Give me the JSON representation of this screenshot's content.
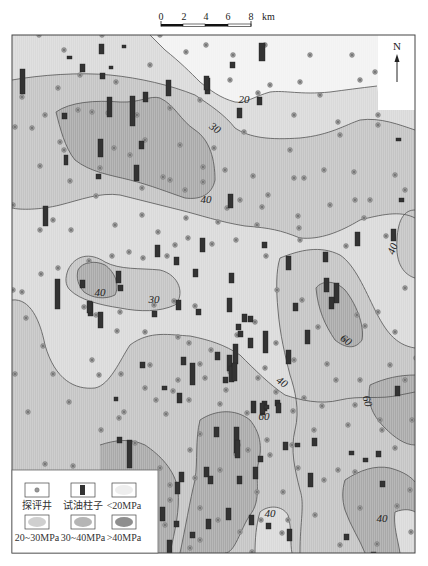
{
  "scale_bar": {
    "ticks": [
      "0",
      "2",
      "4",
      "6",
      "8"
    ],
    "unit": "km"
  },
  "north_arrow": {
    "label": "N"
  },
  "colors": {
    "lt20": "#f2f2f2",
    "20_30": "#dadada",
    "30_40": "#c4c4c4",
    "gt40": "#a9a9a9",
    "contour": "#555555",
    "well_fill": "#9a9a9a",
    "column_fill": "#333333",
    "frame": "#444444"
  },
  "contour_labels": [
    {
      "text": "20",
      "x": 244,
      "y": 103,
      "rot": 0
    },
    {
      "text": "30",
      "x": 213,
      "y": 131,
      "rot": 35
    },
    {
      "text": "40",
      "x": 206,
      "y": 203,
      "rot": 0
    },
    {
      "text": "40",
      "x": 100,
      "y": 296,
      "rot": 0
    },
    {
      "text": "30",
      "x": 154,
      "y": 303,
      "rot": 0
    },
    {
      "text": "40",
      "x": 396,
      "y": 250,
      "rot": -70
    },
    {
      "text": "60",
      "x": 344,
      "y": 343,
      "rot": 35
    },
    {
      "text": "40",
      "x": 280,
      "y": 385,
      "rot": 35
    },
    {
      "text": "60",
      "x": 364,
      "y": 402,
      "rot": 75
    },
    {
      "text": "60",
      "x": 264,
      "y": 420,
      "rot": 0
    },
    {
      "text": "40",
      "x": 270,
      "y": 517,
      "rot": 0
    },
    {
      "text": "40",
      "x": 382,
      "y": 522,
      "rot": 0
    }
  ],
  "legend": {
    "items": [
      {
        "label": "探评井",
        "symbol": "well"
      },
      {
        "label": "试油柱子",
        "symbol": "column"
      },
      {
        "label": "<20MPa",
        "symbol": "zone-lt20"
      },
      {
        "label": "20~30MPa",
        "symbol": "zone-20-30"
      },
      {
        "label": "30~40MPa",
        "symbol": "zone-30-40"
      },
      {
        "label": ">40MPa",
        "symbol": "zone-gt40"
      }
    ]
  },
  "wells": [
    [
      39,
      35
    ],
    [
      64,
      50
    ],
    [
      102,
      35
    ],
    [
      160,
      35
    ],
    [
      206,
      45
    ],
    [
      233,
      55
    ],
    [
      265,
      45
    ],
    [
      310,
      55
    ],
    [
      352,
      55
    ],
    [
      375,
      72
    ],
    [
      58,
      88
    ],
    [
      80,
      75
    ],
    [
      116,
      82
    ],
    [
      150,
      65
    ],
    [
      186,
      52
    ],
    [
      230,
      80
    ],
    [
      270,
      85
    ],
    [
      300,
      82
    ],
    [
      320,
      95
    ],
    [
      360,
      80
    ],
    [
      22,
      97
    ],
    [
      45,
      115
    ],
    [
      78,
      110
    ],
    [
      108,
      113
    ],
    [
      137,
      115
    ],
    [
      170,
      108
    ],
    [
      200,
      100
    ],
    [
      258,
      93
    ],
    [
      294,
      115
    ],
    [
      338,
      122
    ],
    [
      378,
      115
    ],
    [
      60,
      142
    ],
    [
      92,
      112
    ],
    [
      114,
      148
    ],
    [
      145,
      140
    ],
    [
      180,
      145
    ],
    [
      214,
      148
    ],
    [
      244,
      132
    ],
    [
      290,
      150
    ],
    [
      340,
      135
    ],
    [
      378,
      125
    ],
    [
      15,
      127
    ],
    [
      32,
      128
    ],
    [
      64,
      150
    ],
    [
      100,
      168
    ],
    [
      130,
      155
    ],
    [
      163,
      177
    ],
    [
      203,
      167
    ],
    [
      225,
      170
    ],
    [
      253,
      176
    ],
    [
      294,
      178
    ],
    [
      324,
      170
    ],
    [
      354,
      172
    ],
    [
      395,
      175
    ],
    [
      40,
      166
    ],
    [
      70,
      181
    ],
    [
      96,
      196
    ],
    [
      142,
      188
    ],
    [
      170,
      180
    ],
    [
      185,
      190
    ],
    [
      203,
      182
    ],
    [
      240,
      200
    ],
    [
      268,
      195
    ],
    [
      304,
      178
    ],
    [
      355,
      200
    ],
    [
      405,
      190
    ],
    [
      13,
      205
    ],
    [
      53,
      220
    ],
    [
      142,
      215
    ],
    [
      186,
      218
    ],
    [
      227,
      208
    ],
    [
      262,
      207
    ],
    [
      298,
      216
    ],
    [
      330,
      205
    ],
    [
      370,
      200
    ],
    [
      40,
      230
    ],
    [
      71,
      230
    ],
    [
      115,
      225
    ],
    [
      129,
      252
    ],
    [
      158,
      232
    ],
    [
      175,
      245
    ],
    [
      218,
      222
    ],
    [
      257,
      225
    ],
    [
      299,
      228
    ],
    [
      364,
      218
    ],
    [
      22,
      292
    ],
    [
      41,
      274
    ],
    [
      58,
      268
    ],
    [
      89,
      261
    ],
    [
      112,
      256
    ],
    [
      143,
      258
    ],
    [
      167,
      256
    ],
    [
      188,
      238
    ],
    [
      212,
      244
    ],
    [
      236,
      240
    ],
    [
      266,
      256
    ],
    [
      300,
      240
    ],
    [
      346,
      246
    ],
    [
      386,
      236
    ],
    [
      84,
      307
    ],
    [
      96,
      315
    ],
    [
      120,
      312
    ],
    [
      154,
      305
    ],
    [
      174,
      301
    ],
    [
      195,
      306
    ],
    [
      255,
      322
    ],
    [
      277,
      290
    ],
    [
      302,
      300
    ],
    [
      318,
      327
    ],
    [
      357,
      315
    ],
    [
      378,
      312
    ],
    [
      405,
      288
    ],
    [
      13,
      290
    ],
    [
      26,
      318
    ],
    [
      117,
      331
    ],
    [
      145,
      332
    ],
    [
      178,
      337
    ],
    [
      189,
      343
    ],
    [
      211,
      350
    ],
    [
      237,
      335
    ],
    [
      276,
      343
    ],
    [
      344,
      339
    ],
    [
      365,
      326
    ],
    [
      395,
      332
    ],
    [
      43,
      346
    ],
    [
      92,
      360
    ],
    [
      121,
      374
    ],
    [
      150,
      365
    ],
    [
      178,
      380
    ],
    [
      200,
      364
    ],
    [
      230,
      372
    ],
    [
      265,
      368
    ],
    [
      294,
      360
    ],
    [
      327,
      364
    ],
    [
      360,
      380
    ],
    [
      390,
      365
    ],
    [
      416,
      358
    ],
    [
      15,
      374
    ],
    [
      53,
      374
    ],
    [
      99,
      375
    ],
    [
      145,
      388
    ],
    [
      173,
      391
    ],
    [
      205,
      378
    ],
    [
      226,
      390
    ],
    [
      258,
      378
    ],
    [
      276,
      392
    ],
    [
      304,
      398
    ],
    [
      336,
      380
    ],
    [
      355,
      405
    ],
    [
      405,
      380
    ],
    [
      28,
      412
    ],
    [
      69,
      402
    ],
    [
      124,
      412
    ],
    [
      156,
      400
    ],
    [
      189,
      400
    ],
    [
      220,
      404
    ],
    [
      247,
      413
    ],
    [
      293,
      411
    ],
    [
      322,
      406
    ],
    [
      380,
      420
    ],
    [
      101,
      430
    ],
    [
      119,
      418
    ],
    [
      166,
      414
    ],
    [
      200,
      434
    ],
    [
      238,
      445
    ],
    [
      267,
      440
    ],
    [
      292,
      445
    ],
    [
      314,
      430
    ],
    [
      348,
      425
    ],
    [
      382,
      430
    ],
    [
      412,
      420
    ],
    [
      45,
      464
    ],
    [
      73,
      466
    ],
    [
      135,
      443
    ],
    [
      160,
      468
    ],
    [
      190,
      450
    ],
    [
      236,
      454
    ],
    [
      248,
      450
    ],
    [
      270,
      455
    ],
    [
      298,
      468
    ],
    [
      338,
      470
    ],
    [
      395,
      448
    ],
    [
      170,
      485
    ],
    [
      195,
      478
    ],
    [
      220,
      470
    ],
    [
      257,
      492
    ],
    [
      283,
      492
    ],
    [
      324,
      480
    ],
    [
      355,
      472
    ],
    [
      410,
      490
    ],
    [
      170,
      500
    ],
    [
      200,
      508
    ],
    [
      218,
      520
    ],
    [
      261,
      520
    ],
    [
      288,
      520
    ],
    [
      315,
      515
    ],
    [
      360,
      508
    ],
    [
      397,
      506
    ],
    [
      130,
      545
    ],
    [
      165,
      525
    ],
    [
      200,
      540
    ],
    [
      240,
      532
    ],
    [
      282,
      533
    ],
    [
      340,
      545
    ],
    [
      377,
      544
    ],
    [
      411,
      532
    ],
    [
      128,
      555
    ],
    [
      190,
      548
    ],
    [
      234,
      556
    ],
    [
      252,
      552
    ],
    [
      281,
      561
    ],
    [
      315,
      560
    ],
    [
      352,
      560
    ]
  ],
  "columns": [
    [
      99,
      44,
      5,
      10
    ],
    [
      67,
      56,
      5,
      3
    ],
    [
      259,
      43,
      6,
      18
    ],
    [
      122,
      45,
      4,
      3
    ],
    [
      80,
      64,
      5,
      8
    ],
    [
      100,
      73,
      5,
      6
    ],
    [
      109,
      66,
      4,
      3
    ],
    [
      20,
      69,
      5,
      25
    ],
    [
      130,
      96,
      5,
      30
    ],
    [
      107,
      97,
      5,
      20
    ],
    [
      166,
      80,
      5,
      16
    ],
    [
      205,
      78,
      5,
      16
    ],
    [
      139,
      141,
      5,
      8
    ],
    [
      143,
      92,
      5,
      10
    ],
    [
      62,
      113,
      5,
      6
    ],
    [
      98,
      139,
      5,
      18
    ],
    [
      134,
      165,
      5,
      16
    ],
    [
      64,
      155,
      4,
      10
    ],
    [
      96,
      174,
      5,
      5
    ],
    [
      230,
      62,
      5,
      6
    ],
    [
      257,
      97,
      5,
      8
    ],
    [
      237,
      108,
      5,
      10
    ],
    [
      204,
      76,
      5,
      14
    ],
    [
      43,
      206,
      5,
      20
    ],
    [
      228,
      194,
      5,
      14
    ],
    [
      396,
      138,
      5,
      3
    ],
    [
      399,
      198,
      5,
      4
    ],
    [
      155,
      245,
      5,
      12
    ],
    [
      174,
      257,
      5,
      8
    ],
    [
      193,
      269,
      5,
      8
    ],
    [
      116,
      271,
      5,
      12
    ],
    [
      80,
      280,
      5,
      8
    ],
    [
      200,
      238,
      5,
      14
    ],
    [
      262,
      242,
      5,
      6
    ],
    [
      286,
      256,
      5,
      14
    ],
    [
      323,
      252,
      5,
      10
    ],
    [
      55,
      279,
      5,
      30
    ],
    [
      88,
      302,
      5,
      14
    ],
    [
      118,
      285,
      5,
      6
    ],
    [
      176,
      300,
      5,
      10
    ],
    [
      242,
      314,
      5,
      8
    ],
    [
      248,
      316,
      5,
      6
    ],
    [
      355,
      232,
      5,
      14
    ],
    [
      391,
      229,
      5,
      12
    ],
    [
      227,
      298,
      5,
      14
    ],
    [
      229,
      273,
      5,
      10
    ],
    [
      87,
      301,
      5,
      12
    ],
    [
      98,
      312,
      5,
      16
    ],
    [
      324,
      278,
      5,
      14
    ],
    [
      334,
      283,
      5,
      20
    ],
    [
      329,
      297,
      5,
      12
    ],
    [
      286,
      350,
      5,
      14
    ],
    [
      305,
      330,
      5,
      14
    ],
    [
      293,
      303,
      5,
      8
    ],
    [
      236,
      324,
      5,
      6
    ],
    [
      152,
      311,
      5,
      6
    ],
    [
      196,
      309,
      5,
      6
    ],
    [
      248,
      338,
      5,
      10
    ],
    [
      263,
      331,
      5,
      22
    ],
    [
      238,
      331,
      5,
      6
    ],
    [
      227,
      355,
      5,
      16
    ],
    [
      215,
      352,
      5,
      8
    ],
    [
      229,
      366,
      5,
      16
    ],
    [
      233,
      344,
      5,
      20
    ],
    [
      181,
      357,
      5,
      8
    ],
    [
      190,
      363,
      5,
      22
    ],
    [
      162,
      386,
      5,
      4
    ],
    [
      177,
      393,
      5,
      10
    ],
    [
      140,
      362,
      5,
      6
    ],
    [
      114,
      397,
      4,
      4
    ],
    [
      232,
      363,
      5,
      18
    ],
    [
      223,
      377,
      5,
      6
    ],
    [
      262,
      401,
      5,
      10
    ],
    [
      251,
      401,
      5,
      12
    ],
    [
      275,
      400,
      5,
      6
    ],
    [
      395,
      386,
      5,
      10
    ],
    [
      127,
      440,
      5,
      28
    ],
    [
      117,
      437,
      5,
      6
    ],
    [
      234,
      427,
      5,
      26
    ],
    [
      214,
      427,
      5,
      10
    ],
    [
      258,
      456,
      5,
      6
    ],
    [
      253,
      467,
      5,
      12
    ],
    [
      235,
      440,
      5,
      18
    ],
    [
      283,
      442,
      5,
      8
    ],
    [
      312,
      438,
      5,
      8
    ],
    [
      260,
      403,
      5,
      12
    ],
    [
      276,
      403,
      5,
      10
    ],
    [
      264,
      405,
      5,
      4
    ],
    [
      295,
      443,
      5,
      4
    ],
    [
      376,
      451,
      5,
      6
    ],
    [
      204,
      467,
      5,
      10
    ],
    [
      179,
      472,
      5,
      10
    ],
    [
      208,
      476,
      5,
      8
    ],
    [
      237,
      476,
      5,
      8
    ],
    [
      308,
      473,
      5,
      14
    ],
    [
      349,
      451,
      5,
      4
    ],
    [
      363,
      458,
      5,
      4
    ],
    [
      380,
      481,
      5,
      6
    ],
    [
      133,
      505,
      5,
      12
    ],
    [
      160,
      507,
      5,
      14
    ],
    [
      206,
      519,
      5,
      10
    ],
    [
      249,
      515,
      5,
      10
    ],
    [
      287,
      529,
      5,
      12
    ],
    [
      174,
      521,
      5,
      6
    ],
    [
      167,
      540,
      5,
      14
    ],
    [
      133,
      526,
      5,
      8
    ],
    [
      190,
      532,
      5,
      6
    ],
    [
      226,
      508,
      5,
      12
    ],
    [
      266,
      523,
      5,
      6
    ],
    [
      371,
      552,
      5,
      6
    ],
    [
      344,
      534,
      5,
      6
    ],
    [
      175,
      482,
      5,
      12
    ],
    [
      153,
      503,
      5,
      6
    ]
  ]
}
